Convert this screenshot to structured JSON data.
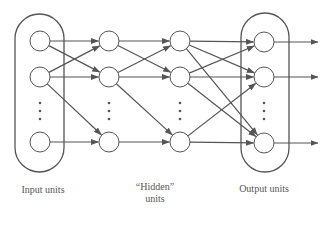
{
  "diagram": {
    "colors": {
      "stroke": "#555555",
      "node_fill": "#ffffff",
      "text": "#555555",
      "background": "#ffffff"
    },
    "layers": [
      {
        "id": "input",
        "x": 40,
        "nodes": [
          41,
          77,
          142
        ],
        "dots": [
          103,
          111,
          119
        ],
        "boxed": true
      },
      {
        "id": "hidden1",
        "x": 109,
        "nodes": [
          41,
          77,
          142
        ],
        "dots": [
          103,
          111,
          119
        ],
        "boxed": false
      },
      {
        "id": "hidden2",
        "x": 180,
        "nodes": [
          41,
          77,
          142
        ],
        "dots": [
          103,
          111,
          119
        ],
        "boxed": false
      },
      {
        "id": "output",
        "x": 264,
        "nodes": [
          42,
          77,
          143
        ],
        "dots": [
          103,
          111,
          119
        ],
        "boxed": true
      }
    ],
    "node_radius": 10,
    "boxes": [
      {
        "id": "input-box",
        "x": 15,
        "y": 14,
        "w": 49,
        "h": 158
      },
      {
        "id": "output-box",
        "x": 241,
        "y": 13,
        "w": 48,
        "h": 159
      }
    ],
    "edges": [
      {
        "from": [
          "input",
          0
        ],
        "to": [
          "hidden1",
          0
        ]
      },
      {
        "from": [
          "input",
          0
        ],
        "to": [
          "hidden1",
          1
        ]
      },
      {
        "from": [
          "input",
          1
        ],
        "to": [
          "hidden1",
          0
        ]
      },
      {
        "from": [
          "input",
          1
        ],
        "to": [
          "hidden1",
          1
        ]
      },
      {
        "from": [
          "input",
          1
        ],
        "to": [
          "hidden1",
          2
        ]
      },
      {
        "from": [
          "input",
          2
        ],
        "to": [
          "hidden1",
          2
        ]
      },
      {
        "from": [
          "hidden1",
          0
        ],
        "to": [
          "hidden2",
          0
        ]
      },
      {
        "from": [
          "hidden1",
          0
        ],
        "to": [
          "hidden2",
          1
        ]
      },
      {
        "from": [
          "hidden1",
          1
        ],
        "to": [
          "hidden2",
          0
        ]
      },
      {
        "from": [
          "hidden1",
          1
        ],
        "to": [
          "hidden2",
          1
        ]
      },
      {
        "from": [
          "hidden1",
          1
        ],
        "to": [
          "hidden2",
          2
        ]
      },
      {
        "from": [
          "hidden1",
          2
        ],
        "to": [
          "hidden2",
          2
        ]
      },
      {
        "from": [
          "hidden2",
          0
        ],
        "to": [
          "output",
          0
        ]
      },
      {
        "from": [
          "hidden2",
          0
        ],
        "to": [
          "output",
          1
        ]
      },
      {
        "from": [
          "hidden2",
          0
        ],
        "to": [
          "output",
          2
        ]
      },
      {
        "from": [
          "hidden2",
          1
        ],
        "to": [
          "output",
          0
        ]
      },
      {
        "from": [
          "hidden2",
          1
        ],
        "to": [
          "output",
          1
        ]
      },
      {
        "from": [
          "hidden2",
          1
        ],
        "to": [
          "output",
          2
        ]
      },
      {
        "from": [
          "hidden2",
          2
        ],
        "to": [
          "output",
          1
        ]
      },
      {
        "from": [
          "hidden2",
          2
        ],
        "to": [
          "output",
          2
        ]
      }
    ],
    "output_arrows": {
      "from_layer": "output",
      "end_x": 318
    },
    "labels": {
      "input": "Input units",
      "hidden_line1": "“Hidden”",
      "hidden_line2": "units",
      "output": "Output units"
    }
  }
}
